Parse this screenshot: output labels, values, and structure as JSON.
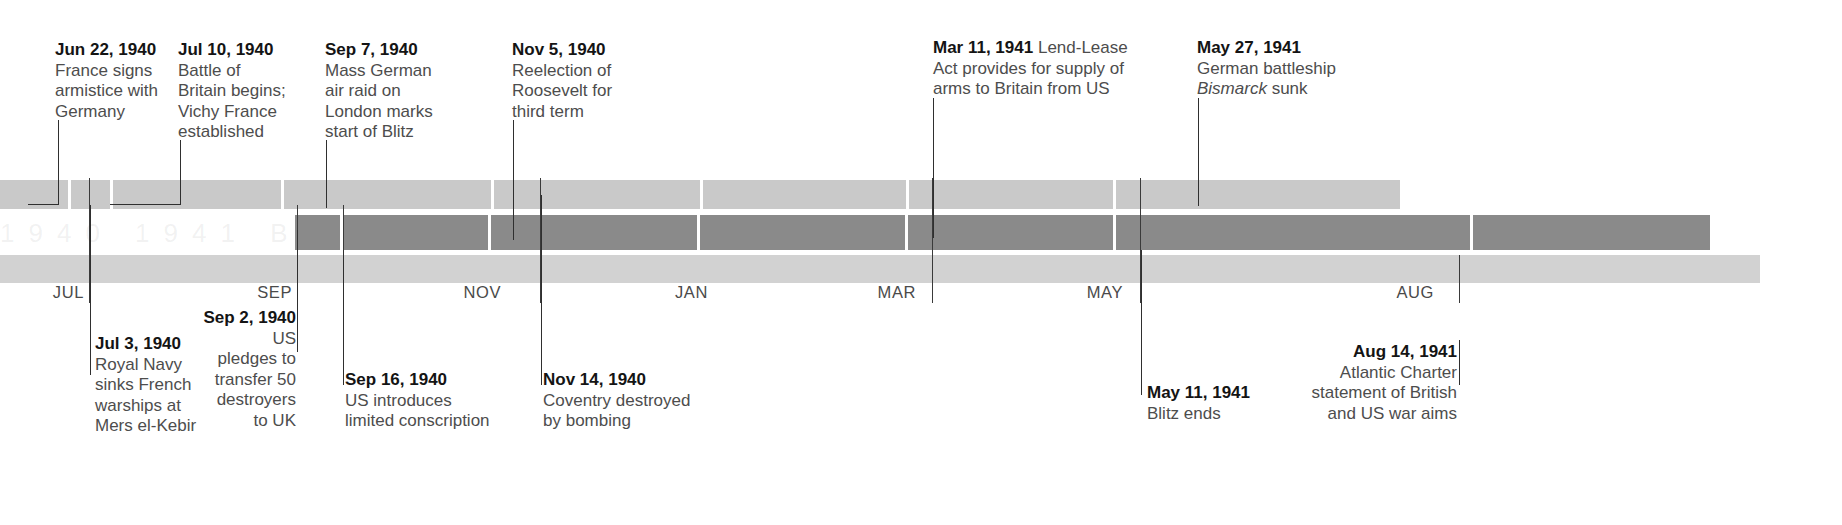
{
  "figure": {
    "kind": "historical-timeline",
    "span_label": "Jun 1940 – Aug 1941",
    "colors": {
      "bar_upper": "#c9c9c9",
      "bar_middle": "#8a8a8a",
      "bar_axis": "#d2d2d2",
      "leader_line": "#2f2f2f",
      "date_text": "#141414",
      "body_text": "#4d4d4d"
    }
  },
  "axis": {
    "ticks": [
      {
        "label": "JUL",
        "x": 88
      },
      {
        "label": "SEP",
        "x": 296
      },
      {
        "label": "NOV",
        "x": 505
      },
      {
        "label": "JAN",
        "x": 712
      },
      {
        "label": "MAR",
        "x": 920
      },
      {
        "label": "MAY",
        "x": 1127
      },
      {
        "label": "AUG",
        "x": 1438
      }
    ]
  },
  "notes_above": [
    {
      "id": "jun-22-1940",
      "date": "Jun 22, 1940",
      "lines": [
        "France signs",
        "armistice with",
        "Germany"
      ],
      "x": 55,
      "y": 40,
      "align": "left",
      "inline": false
    },
    {
      "id": "jul-10-1940",
      "date": "Jul 10, 1940",
      "lines": [
        "Battle of",
        "Britain begins;",
        "Vichy France",
        "established"
      ],
      "x": 178,
      "y": 40,
      "align": "left",
      "inline": false
    },
    {
      "id": "sep-7-1940",
      "date": "Sep 7, 1940",
      "lines": [
        "Mass German",
        "air raid on",
        "London marks",
        "start of Blitz"
      ],
      "x": 325,
      "y": 40,
      "align": "left",
      "inline": false
    },
    {
      "id": "nov-5-1940",
      "date": "Nov 5, 1940",
      "lines": [
        "Reelection of",
        "Roosevelt for",
        "third term"
      ],
      "x": 512,
      "y": 40,
      "align": "left",
      "inline": false
    },
    {
      "id": "mar-11-1941",
      "date": "Mar 11, 1941",
      "lines": [
        "Lend-Lease",
        "Act provides for supply of",
        "arms to Britain from US"
      ],
      "x": 933,
      "y": 38,
      "align": "left",
      "inline": true
    },
    {
      "id": "may-27-1941",
      "date": "May 27, 1941",
      "lines": [
        "German battleship",
        "Bismarck sunk"
      ],
      "italic_word": "Bismarck",
      "x": 1197,
      "y": 38,
      "align": "left",
      "inline": false
    }
  ],
  "notes_below": [
    {
      "id": "jul-3-1940",
      "date": "Jul 3, 1940",
      "lines": [
        "Royal Navy",
        "sinks French",
        "warships at",
        "Mers el-Kebir"
      ],
      "x": 95,
      "y": 334,
      "align": "left",
      "inline": false
    },
    {
      "id": "sep-2-1940",
      "date": "Sep 2, 1940",
      "lines": [
        "US",
        "pledges to",
        "transfer 50",
        "destroyers",
        "to UK"
      ],
      "x": 216,
      "y": 308,
      "align": "right",
      "inline": true
    },
    {
      "id": "sep-16-1940",
      "date": "Sep 16, 1940",
      "lines": [
        "US introduces",
        "limited conscription"
      ],
      "x": 345,
      "y": 370,
      "align": "left",
      "inline": false
    },
    {
      "id": "nov-14-1940",
      "date": "Nov 14, 1940",
      "lines": [
        "Coventry destroyed",
        "by bombing"
      ],
      "x": 543,
      "y": 370,
      "align": "left",
      "inline": false
    },
    {
      "id": "may-11-1941",
      "date": "May 11, 1941",
      "lines": [
        "Blitz ends"
      ],
      "x": 1147,
      "y": 383,
      "align": "left",
      "inline": false
    },
    {
      "id": "aug-14-1941",
      "date": "Aug 14, 1941",
      "lines": [
        "Atlantic Charter",
        "statement of British",
        "and US war aims"
      ],
      "x": 1291,
      "y": 342,
      "align": "right",
      "inline": false
    }
  ],
  "ghost_text": "1940    1941    BATTLE    OF    BRITAIN"
}
